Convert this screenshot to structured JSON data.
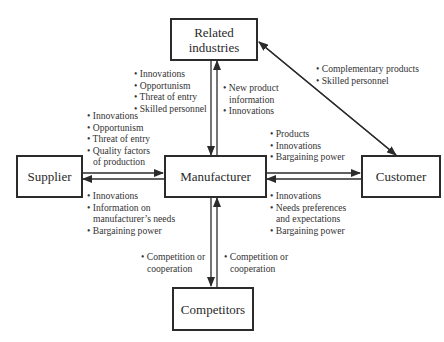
{
  "nodes": {
    "related": {
      "label_line1": "Related",
      "label_line2": "industries"
    },
    "supplier": {
      "label": "Supplier"
    },
    "manufacturer": {
      "label": "Manufacturer"
    },
    "customer": {
      "label": "Customer"
    },
    "competitors": {
      "label": "Competitors"
    }
  },
  "labels": {
    "related_to_manufacturer": [
      "• Innovations",
      "• Opportunism",
      "• Threat of entry",
      "• Skilled personnel"
    ],
    "manufacturer_to_related": [
      "• New product",
      "information",
      "• Innovations"
    ],
    "related_customer": [
      "• Complementary products",
      "• Skilled personnel"
    ],
    "supplier_to_manufacturer": [
      "• Innovations",
      "• Opportunism",
      "• Threat of entry",
      "• Quality factors",
      "of production"
    ],
    "manufacturer_to_supplier": [
      "• Innovations",
      "• Information on",
      "manufacturer’s needs",
      "• Bargaining power"
    ],
    "manufacturer_to_customer": [
      "• Products",
      "• Innovations",
      "• Bargaining power"
    ],
    "customer_to_manufacturer": [
      "• Innovations",
      "• Needs preferences",
      "and expectations",
      "• Bargaining power"
    ],
    "manufacturer_to_competitors": [
      "• Competition or",
      "cooperation"
    ],
    "competitors_to_manufacturer": [
      "• Competition or",
      "cooperation"
    ]
  },
  "colors": {
    "line": "#2b2b2b",
    "text": "#333333"
  }
}
